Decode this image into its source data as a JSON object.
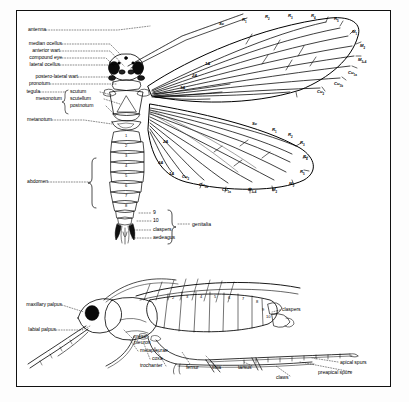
{
  "plate": {
    "title": "Caddisfly (Trichoptera) external anatomy",
    "views": [
      "dorsal-view",
      "lateral-view"
    ],
    "background_color": "#ffffff",
    "ink_color": "#000000"
  },
  "dorsal": {
    "labels_left": [
      {
        "text": "antenna",
        "x": 22,
        "y": 30,
        "lead_to_x": 118
      },
      {
        "text": "median ocellus",
        "x": 22,
        "y": 44,
        "lead_to_x": 112
      },
      {
        "text": "anterior wart",
        "x": 22,
        "y": 51,
        "lead_to_x": 112
      },
      {
        "text": "compound eye",
        "x": 22,
        "y": 58,
        "lead_to_x": 108
      },
      {
        "text": "lateral ocellus",
        "x": 22,
        "y": 65,
        "lead_to_x": 110
      },
      {
        "text": "postero-lateral wart",
        "x": 22,
        "y": 77,
        "lead_to_x": 112
      },
      {
        "text": "pronotum",
        "x": 22,
        "y": 84,
        "lead_to_x": 110
      },
      {
        "text": "tegula",
        "x": 22,
        "y": 92,
        "lead_to_x": 76
      },
      {
        "text": "mesonotum",
        "x": 22,
        "y": 99,
        "lead_to_x": 70
      },
      {
        "text": "metanotum",
        "x": 22,
        "y": 120,
        "lead_to_x": 86
      },
      {
        "text": "abdomen",
        "x": 22,
        "y": 182,
        "lead_to_x": 92
      }
    ],
    "mesonotum_parts": [
      {
        "text": "scutum",
        "x": 72,
        "y": 92
      },
      {
        "text": "scutellum",
        "x": 72,
        "y": 99
      },
      {
        "text": "postnotum",
        "x": 72,
        "y": 106
      }
    ],
    "abdomen_segments": [
      "1",
      "2",
      "3",
      "4",
      "5",
      "6",
      "7",
      "8"
    ],
    "genitalia_parts": [
      {
        "text": "9",
        "x": 143,
        "y": 213
      },
      {
        "text": "10",
        "x": 143,
        "y": 221
      },
      {
        "text": "claspers",
        "x": 143,
        "y": 230
      },
      {
        "text": "aedeagus",
        "x": 143,
        "y": 238
      }
    ],
    "genitalia_group_label": "genitalia"
  },
  "forewing_veins": [
    {
      "text": "Sc",
      "sub": "",
      "x": 219,
      "y": 22
    },
    {
      "text": "R",
      "sub": "1",
      "x": 242,
      "y": 18
    },
    {
      "text": "R",
      "sub": "2",
      "x": 265,
      "y": 15
    },
    {
      "text": "R",
      "sub": "3",
      "x": 288,
      "y": 14
    },
    {
      "text": "R",
      "sub": "4",
      "x": 311,
      "y": 14
    },
    {
      "text": "R",
      "sub": "5",
      "x": 334,
      "y": 17
    },
    {
      "text": "M",
      "sub": "1",
      "x": 352,
      "y": 30
    },
    {
      "text": "M",
      "sub": "2",
      "x": 360,
      "y": 44
    },
    {
      "text": "M",
      "sub": "3+4",
      "x": 358,
      "y": 58
    },
    {
      "text": "Cu",
      "sub": "1a",
      "x": 348,
      "y": 71
    },
    {
      "text": "Cu",
      "sub": "1b",
      "x": 334,
      "y": 82
    },
    {
      "text": "Cu",
      "sub": "2",
      "x": 317,
      "y": 90
    },
    {
      "text": "1A",
      "sub": "",
      "x": 205,
      "y": 62
    },
    {
      "text": "2A",
      "sub": "",
      "x": 192,
      "y": 74
    },
    {
      "text": "3A",
      "sub": "",
      "x": 180,
      "y": 86
    }
  ],
  "hindwing_veins": [
    {
      "text": "Sc",
      "sub": "",
      "x": 252,
      "y": 122
    },
    {
      "text": "R",
      "sub": "1",
      "x": 272,
      "y": 128
    },
    {
      "text": "R",
      "sub": "2",
      "x": 288,
      "y": 133
    },
    {
      "text": "R",
      "sub": "3",
      "x": 300,
      "y": 141
    },
    {
      "text": "R",
      "sub": "4",
      "x": 303,
      "y": 155
    },
    {
      "text": "R",
      "sub": "5",
      "x": 300,
      "y": 170
    },
    {
      "text": "M",
      "sub": "1",
      "x": 289,
      "y": 182
    },
    {
      "text": "M",
      "sub": "2",
      "x": 272,
      "y": 188
    },
    {
      "text": "M",
      "sub": "3+4",
      "x": 248,
      "y": 188
    },
    {
      "text": "Cu",
      "sub": "1a",
      "x": 222,
      "y": 188
    },
    {
      "text": "Cu",
      "sub": "1b",
      "x": 199,
      "y": 183
    },
    {
      "text": "Cu",
      "sub": "2",
      "x": 182,
      "y": 175
    },
    {
      "text": "1A",
      "sub": "",
      "x": 169,
      "y": 172
    },
    {
      "text": "2A",
      "sub": "",
      "x": 163,
      "y": 140
    },
    {
      "text": "3A",
      "sub": "",
      "x": 158,
      "y": 161
    }
  ],
  "lateral": {
    "labels_left": [
      {
        "text": "maxillary palpus",
        "x": 28,
        "y": 305,
        "lead_to_x": 82
      },
      {
        "text": "labial palpus",
        "x": 28,
        "y": 330,
        "lead_to_x": 74
      }
    ],
    "labels_center": [
      {
        "text": "meso-",
        "x": 134,
        "y": 337
      },
      {
        "text": "pleuron",
        "x": 134,
        "y": 343
      },
      {
        "text": "metapleurae",
        "x": 140,
        "y": 351
      },
      {
        "text": "coxa",
        "x": 152,
        "y": 359
      },
      {
        "text": "trochanter",
        "x": 140,
        "y": 366
      },
      {
        "text": "femur",
        "x": 186,
        "y": 368
      },
      {
        "text": "tibia",
        "x": 212,
        "y": 368
      },
      {
        "text": "tarsus",
        "x": 238,
        "y": 368
      },
      {
        "text": "claws",
        "x": 276,
        "y": 378
      }
    ],
    "labels_right": [
      {
        "text": "claspers",
        "x": 282,
        "y": 310
      },
      {
        "text": "apical spurs",
        "x": 340,
        "y": 363
      },
      {
        "text": "preapical spurs",
        "x": 318,
        "y": 373
      }
    ],
    "abdomen_segments": [
      "1",
      "2",
      "3",
      "4",
      "5",
      "6",
      "7",
      "8",
      "9",
      "10"
    ]
  }
}
